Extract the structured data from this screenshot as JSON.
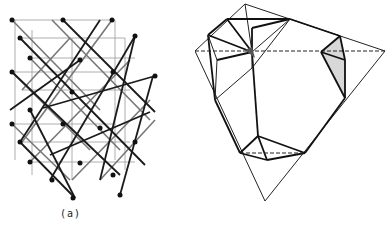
{
  "figure": {
    "panels": [
      {
        "id": "a",
        "label": "(a)",
        "description": "lattice of corner-sharing tetrahedra / cubic framework with atom nodes"
      },
      {
        "id": "b",
        "label": "(b)",
        "description": "large tetrahedron with four small tetrahedra at its corners, one face shaded"
      }
    ]
  },
  "colors": {
    "line_dark": "#1a1a1a",
    "line_gray": "#777777",
    "line_light": "#aaaaaa",
    "shade": "#d8d8d8"
  }
}
